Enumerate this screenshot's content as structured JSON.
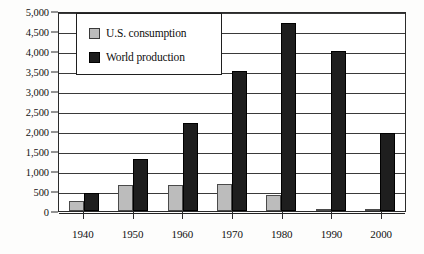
{
  "chart_data": {
    "type": "bar",
    "title": "",
    "subtitle": "",
    "xlabel": "",
    "ylabel": "",
    "categories": [
      "1940",
      "1950",
      "1960",
      "1970",
      "1980",
      "1990",
      "2000"
    ],
    "series": [
      {
        "name": "U.S. consumption",
        "color": "#bcbcbc",
        "values": [
          250,
          650,
          650,
          680,
          400,
          50,
          20
        ]
      },
      {
        "name": "World production",
        "color": "#1e1e1e",
        "values": [
          450,
          1300,
          2200,
          3500,
          4700,
          4000,
          1950
        ]
      }
    ],
    "ylim": [
      0,
      5000
    ],
    "ytick_values": [
      0,
      500,
      1000,
      1500,
      2000,
      2500,
      3000,
      3500,
      4000,
      4500,
      5000
    ],
    "ytick_labels": [
      "0",
      "500",
      "1,000",
      "1,500",
      "2,000",
      "2,500",
      "3,000",
      "3,500",
      "4,000",
      "4,500",
      "5,000"
    ],
    "grid": true,
    "legend_position": "upper-left",
    "legend": [
      "U.S. consumption",
      "World production"
    ]
  },
  "legend": {
    "items": [
      {
        "label": "U.S. consumption",
        "swatch": "legend-swatch-us-consumption"
      },
      {
        "label": "World production",
        "swatch": "legend-swatch-world-production"
      }
    ]
  }
}
